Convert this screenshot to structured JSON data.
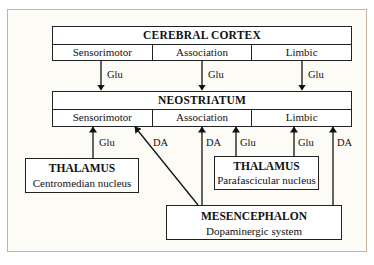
{
  "cortex": {
    "title": "CEREBRAL CORTEX",
    "cells": [
      "Sensorimotor",
      "Association",
      "Limbic"
    ]
  },
  "neostriatum": {
    "title": "NEOSTRIATUM",
    "cells": [
      "Sensorimotor",
      "Association",
      "Limbic"
    ]
  },
  "thalamus_left": {
    "title": "THALAMUS",
    "subtitle": "Centromedian nucleus"
  },
  "thalamus_right": {
    "title": "THALAMUS",
    "subtitle": "Parafascicular nucleus"
  },
  "mesencephalon": {
    "title": "MESENCEPHALON",
    "subtitle": "Dopaminergic system"
  },
  "connections": [
    {
      "from": "Cerebral cortex Sensorimotor",
      "to": "Neostriatum Sensorimotor",
      "label": "Glu"
    },
    {
      "from": "Cerebral cortex Association",
      "to": "Neostriatum Association",
      "label": "Glu"
    },
    {
      "from": "Cerebral cortex Limbic",
      "to": "Neostriatum Limbic",
      "label": "Glu"
    },
    {
      "from": "Thalamus Centromedian nucleus",
      "to": "Neostriatum Sensorimotor",
      "label": "Glu"
    },
    {
      "from": "Mesencephalon",
      "to": "Neostriatum Sensorimotor",
      "label": "DA"
    },
    {
      "from": "Mesencephalon",
      "to": "Neostriatum Association",
      "label": "DA"
    },
    {
      "from": "Thalamus Parafascicular nucleus",
      "to": "Neostriatum Association",
      "label": "Glu"
    },
    {
      "from": "Thalamus Parafascicular nucleus",
      "to": "Neostriatum Limbic",
      "label": "Glu"
    },
    {
      "from": "Mesencephalon",
      "to": "Neostriatum Limbic",
      "label": "DA"
    }
  ]
}
